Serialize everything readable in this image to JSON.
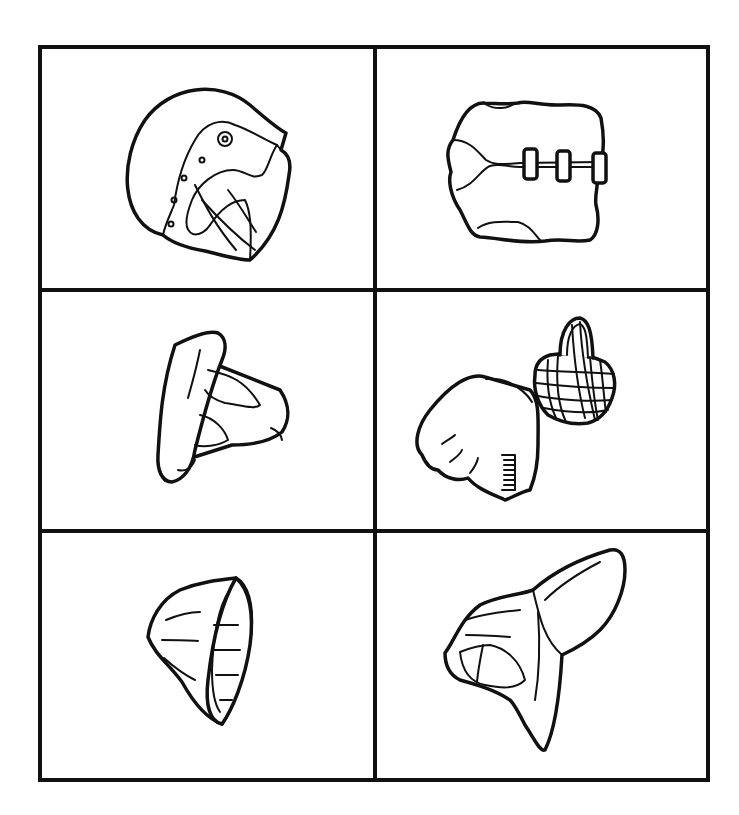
{
  "colors": {
    "line": "#111111",
    "background": "#ffffff"
  },
  "grid": {
    "rows": 3,
    "cols": 2,
    "cells": [
      {
        "id": "cell-1",
        "item": "motorcycle helmet with visor"
      },
      {
        "id": "cell-2",
        "item": "life vest with three buckles"
      },
      {
        "id": "cell-3",
        "item": "shoulder pad / protective cap"
      },
      {
        "id": "cell-4",
        "item": "glove and wire muzzle"
      },
      {
        "id": "cell-5",
        "item": "cup-shaped guard"
      },
      {
        "id": "cell-6",
        "item": "shin / arm guard pad"
      }
    ]
  }
}
